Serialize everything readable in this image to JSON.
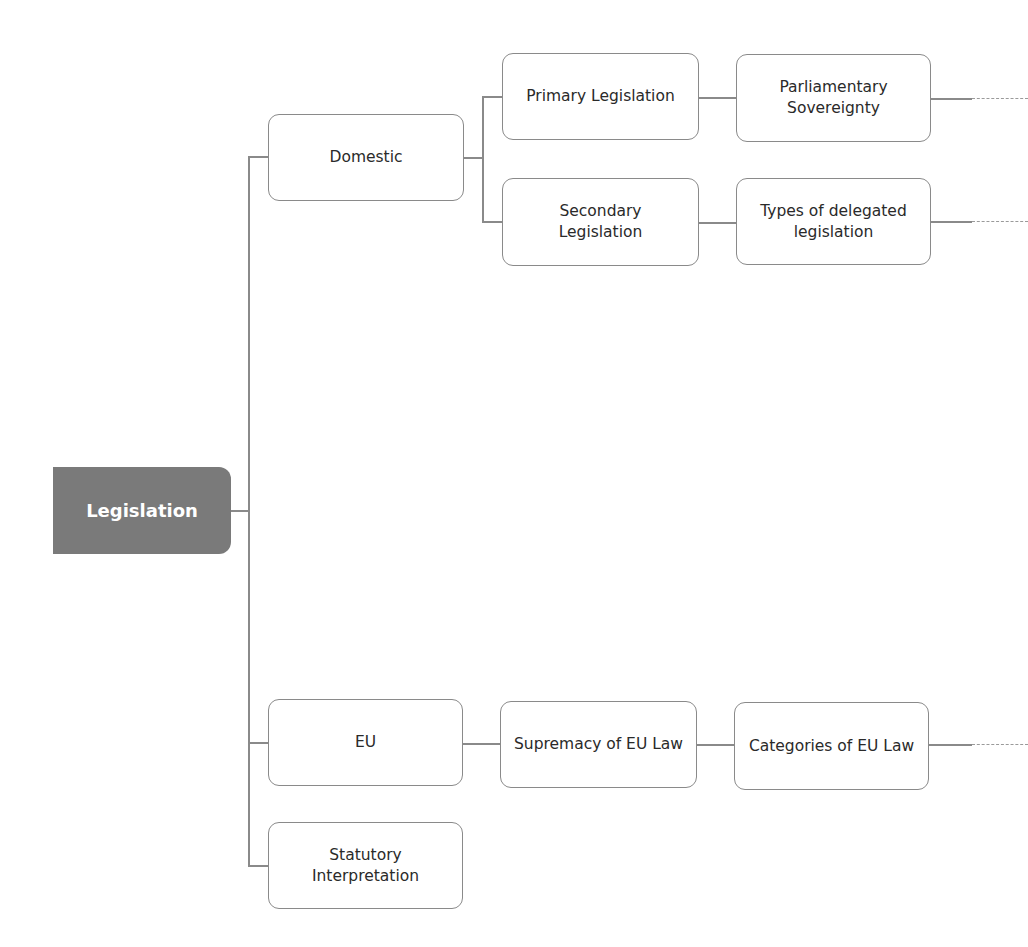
{
  "diagram": {
    "type": "mind-map / tree",
    "root": {
      "label": "Legislation",
      "color": "#7a7a7a"
    },
    "branches": {
      "domestic": {
        "label": "Domestic",
        "children": {
          "primary": {
            "label": "Primary Legislation",
            "next": "Parliamentary\nSovereignty",
            "continues": true
          },
          "secondary": {
            "label": "Secondary\nLegislation",
            "next": "Types of delegated\nlegislation",
            "continues": true
          }
        }
      },
      "eu": {
        "label": "EU",
        "children": {
          "supremacy": {
            "label": "Supremacy of EU Law",
            "next": "Categories of EU Law",
            "continues": true
          }
        }
      },
      "statutory": {
        "label": "Statutory\nInterpretation"
      }
    },
    "colors": {
      "line": "#8a8a8a",
      "node_border": "#8a8a8a",
      "node_text": "#2a2a2a",
      "root_text": "#ffffff"
    }
  }
}
